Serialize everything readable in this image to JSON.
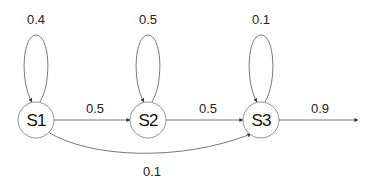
{
  "diagram": {
    "type": "markov-chain",
    "nodes": [
      {
        "id": "S1",
        "label": "S1",
        "self_loop": "0.4"
      },
      {
        "id": "S2",
        "label": "S2",
        "self_loop": "0.5"
      },
      {
        "id": "S3",
        "label": "S3",
        "self_loop": "0.1"
      }
    ],
    "edges": [
      {
        "from": "S1",
        "to": "S1",
        "label": "0.4"
      },
      {
        "from": "S2",
        "to": "S2",
        "label": "0.5"
      },
      {
        "from": "S3",
        "to": "S3",
        "label": "0.1"
      },
      {
        "from": "S1",
        "to": "S2",
        "label": "0.5"
      },
      {
        "from": "S2",
        "to": "S3",
        "label": "0.5"
      },
      {
        "from": "S1",
        "to": "S3",
        "label": "0.1"
      },
      {
        "from": "S3",
        "to": "exit",
        "label": "0.9"
      }
    ]
  }
}
